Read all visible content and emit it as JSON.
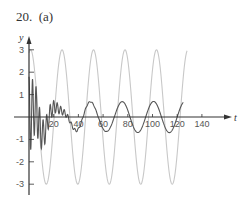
{
  "figure": {
    "label": "20.  (a)"
  },
  "chart_data": {
    "type": "line",
    "title": "",
    "xlabel": "t",
    "ylabel": "y",
    "xlim": [
      0,
      150
    ],
    "ylim": [
      -3.2,
      3.3
    ],
    "x_ticks": [
      20,
      40,
      60,
      80,
      100,
      120,
      140
    ],
    "y_ticks": [
      3,
      2,
      1,
      -1,
      -2,
      -3
    ],
    "grid": false,
    "legend": null,
    "series": [
      {
        "name": "forcing (light gray)",
        "color": "#c8c8c8",
        "description": "sinusoid amplitude 3, period ~25.5",
        "params": {
          "amplitude": 3,
          "omega": 0.2465,
          "peak_t": 128.7,
          "t_start": 0,
          "t_end": 128
        },
        "x": [
          0,
          14.6,
          27.5,
          39.7,
          51.8,
          65.6,
          77.7,
          91.5,
          103.6,
          116.6,
          128
        ],
        "values": [
          3,
          -3,
          3,
          -3,
          3,
          -3,
          3,
          -3,
          3,
          -3,
          3
        ]
      },
      {
        "name": "response (dark)",
        "color": "#555555",
        "description": "initial high-frequency transient decaying to steady sinusoid amplitude ~0.7",
        "params": {
          "amplitude": 0.7,
          "omega": 0.2465,
          "zero_up_t": 120,
          "transient_amp": 1.8,
          "transient_freq": 2.2,
          "decay": 0.09,
          "t_end": 125
        },
        "x": [
          0,
          5,
          10,
          15,
          20,
          25,
          30,
          35,
          40,
          45,
          52,
          60,
          66,
          79,
          92,
          104,
          117,
          125
        ],
        "values": [
          2.0,
          -0.8,
          1.4,
          -1.3,
          0.5,
          0.9,
          0.8,
          -0.2,
          -0.7,
          -0.6,
          0.7,
          0.0,
          -0.7,
          0.7,
          -0.7,
          0.7,
          -0.7,
          0.6
        ]
      }
    ]
  },
  "axes": {
    "x_tick_labels": [
      "20",
      "40",
      "60",
      "80",
      "100",
      "120",
      "140"
    ],
    "y_tick_labels": [
      "3",
      "2",
      "1",
      "-1",
      "-2",
      "-3"
    ],
    "x_var": "t",
    "y_var": "y"
  }
}
